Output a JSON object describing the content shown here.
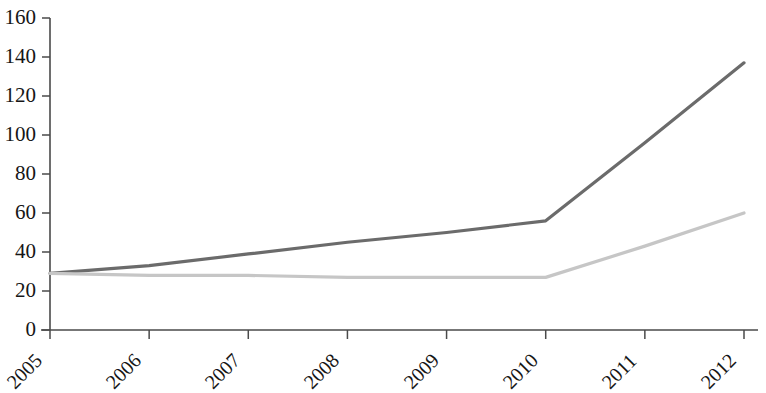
{
  "chart_data": {
    "type": "line",
    "title": "",
    "subtitle": "",
    "xlabel": "",
    "ylabel": "",
    "categories": [
      "2005",
      "2006",
      "2007",
      "2008",
      "2009",
      "2010",
      "2011",
      "2012"
    ],
    "x": [
      2005,
      2006,
      2007,
      2008,
      2009,
      2010,
      2011,
      2012
    ],
    "series": [
      {
        "name": "series-1-dark",
        "color": "#6b6b6b",
        "values": [
          29,
          33,
          39,
          45,
          50,
          56,
          96,
          137
        ]
      },
      {
        "name": "series-2-light",
        "color": "#c6c6c6",
        "values": [
          29,
          28,
          28,
          27,
          27,
          27,
          43,
          60
        ]
      }
    ],
    "ylim": [
      0,
      160
    ],
    "ytick_values": [
      0,
      20,
      40,
      60,
      80,
      100,
      120,
      140,
      160
    ],
    "ytick_labels": [
      "0",
      "20",
      "40",
      "60",
      "80",
      "100",
      "120",
      "140",
      "160"
    ],
    "xtick_labels": [
      "2005",
      "2006",
      "2007",
      "2008",
      "2009",
      "2010",
      "2011",
      "2012"
    ],
    "grid": false,
    "legend": false,
    "legend_position": "none",
    "xtick_label_rotation": -45,
    "axis_color": "#4a4a4a"
  }
}
